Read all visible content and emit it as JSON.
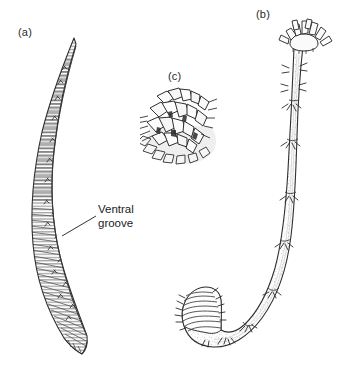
{
  "figure": {
    "domain": "biological-line-drawing",
    "background_color": "#ffffff",
    "ink_color": "#3a3a3a",
    "width": 349,
    "height": 375,
    "panels": [
      {
        "id": "a",
        "label": "(a)",
        "subject": "elongate leaf-shaped body in lateral view with fine transverse hatching",
        "label_x": 18,
        "label_y": 26
      },
      {
        "id": "b",
        "label": "(b)",
        "subject": "whole worm, U-curved tube body with tentacular crown at anterior and annulated posterior",
        "label_x": 256,
        "label_y": 8
      },
      {
        "id": "c",
        "label": "(c)",
        "subject": "detail of blocky crystalline scale cluster",
        "label_x": 168,
        "label_y": 70
      }
    ],
    "annotations": [
      {
        "name": "ventral-groove",
        "lines": [
          "Ventral",
          "groove"
        ],
        "text_x": 98,
        "text_y": 203,
        "leader_from": [
          96,
          216
        ],
        "leader_to": [
          62,
          236
        ]
      }
    ]
  }
}
